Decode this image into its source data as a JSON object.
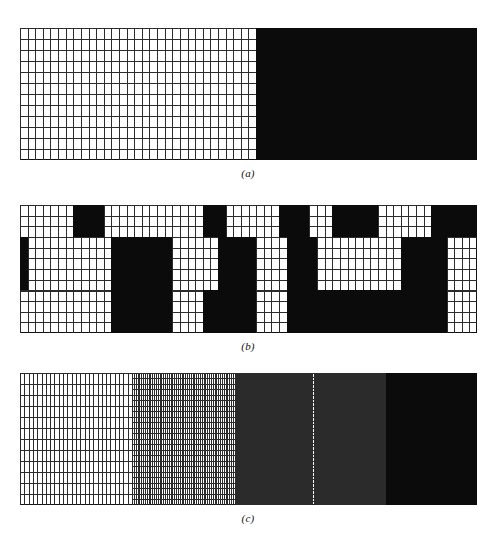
{
  "figure": {
    "background_color": "#ffffff",
    "ink_color": "#0b0b0b",
    "line_color": "#2b2b2b",
    "panels": [
      {
        "id": "a",
        "caption": "(a)",
        "description": "Uniform fine rectangular grid occupying the left half, solid black fill occupying the right half",
        "x": 20,
        "y": 28,
        "width": 457,
        "height": 132,
        "cols": 60,
        "rows": 12,
        "black_start_col": 31
      },
      {
        "id": "b",
        "caption": "(b)",
        "description": "Fine grid with scattered solid black rectangular blocks arranged in three horizontal bands",
        "x": 20,
        "y": 205,
        "width": 457,
        "height": 128,
        "cols": 60,
        "rows": 12,
        "bands": [
          {
            "row_start": 0,
            "row_end": 3
          },
          {
            "row_start": 3,
            "row_end": 8
          },
          {
            "row_start": 8,
            "row_end": 12
          }
        ],
        "blocks": [
          {
            "col": 7,
            "span": 4,
            "row": 0,
            "rows": 3
          },
          {
            "col": 34,
            "span": 4,
            "row": 0,
            "rows": 3
          },
          {
            "col": 41,
            "span": 6,
            "row": 0,
            "rows": 3
          },
          {
            "col": 54,
            "span": 3,
            "row": 0,
            "rows": 3
          },
          {
            "col": 57,
            "span": 3,
            "row": 0,
            "rows": 3
          },
          {
            "col": 24,
            "span": 3,
            "row": 0,
            "rows": 3
          },
          {
            "col": 12,
            "span": 8,
            "row": 3,
            "rows": 5
          },
          {
            "col": 26,
            "span": 5,
            "row": 3,
            "rows": 5
          },
          {
            "col": 35,
            "span": 4,
            "row": 3,
            "rows": 5
          },
          {
            "col": 50,
            "span": 6,
            "row": 3,
            "rows": 5
          },
          {
            "col": 0,
            "span": 1,
            "row": 3,
            "rows": 5
          },
          {
            "col": 12,
            "span": 8,
            "row": 8,
            "rows": 4
          },
          {
            "col": 24,
            "span": 7,
            "row": 8,
            "rows": 4
          },
          {
            "col": 35,
            "span": 21,
            "row": 8,
            "rows": 4
          }
        ]
      },
      {
        "id": "c",
        "caption": "(c)",
        "description": "Progressive grid refinement from coarse cells at the left through successively finer subdivisions to solid black at the right",
        "x": 20,
        "y": 373,
        "width": 457,
        "height": 132,
        "rows": 12,
        "zones": [
          {
            "name": "coarse",
            "start_frac": 0.0,
            "end_frac": 0.245,
            "cols": 26,
            "subrows": 1,
            "alpha": 1.0
          },
          {
            "name": "fine",
            "start_frac": 0.245,
            "end_frac": 0.47,
            "cols": 56,
            "subrows": 2,
            "alpha": 1.0
          },
          {
            "name": "finer",
            "start_frac": 0.47,
            "end_frac": 0.655,
            "cols": 84,
            "subrows": 3,
            "alpha": 1.0
          },
          {
            "name": "finest",
            "start_frac": 0.655,
            "end_frac": 0.8,
            "cols": 140,
            "subrows": 5,
            "alpha": 1.0
          },
          {
            "name": "solid",
            "start_frac": 0.8,
            "end_frac": 1.0,
            "cols": 0,
            "subrows": 0,
            "alpha": 1.0
          }
        ]
      }
    ]
  },
  "captions": {
    "a": "(a)",
    "b": "(b)",
    "c": "(c)"
  }
}
